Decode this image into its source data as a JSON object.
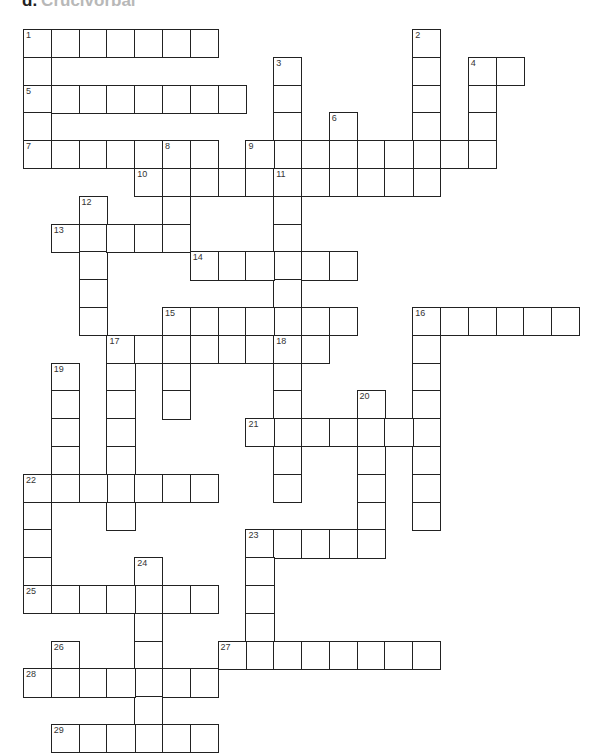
{
  "header": {
    "lead": "d.",
    "title": "Crucivorbal"
  },
  "grid": {
    "origin_x": 23,
    "origin_y": 29,
    "cell": 27.8,
    "border_color": "#222222"
  },
  "words": [
    {
      "num": "1",
      "dir": "across",
      "row": 0,
      "col": 0,
      "len": 7
    },
    {
      "num": "1",
      "dir": "down",
      "row": 0,
      "col": 0,
      "len": 5
    },
    {
      "num": "2",
      "dir": "down",
      "row": 0,
      "col": 14,
      "len": 6
    },
    {
      "num": "3",
      "dir": "down",
      "row": 1,
      "col": 9,
      "len": 4
    },
    {
      "num": "4",
      "dir": "across",
      "row": 1,
      "col": 16,
      "len": 2
    },
    {
      "num": "4",
      "dir": "down",
      "row": 1,
      "col": 16,
      "len": 4
    },
    {
      "num": "5",
      "dir": "across",
      "row": 2,
      "col": 0,
      "len": 8
    },
    {
      "num": "6",
      "dir": "down",
      "row": 3,
      "col": 11,
      "len": 3
    },
    {
      "num": "7",
      "dir": "across",
      "row": 4,
      "col": 0,
      "len": 7
    },
    {
      "num": "8",
      "dir": "down",
      "row": 4,
      "col": 5,
      "len": 4
    },
    {
      "num": "9",
      "dir": "across",
      "row": 4,
      "col": 8,
      "len": 9
    },
    {
      "num": "10",
      "dir": "across",
      "row": 5,
      "col": 4,
      "len": 11
    },
    {
      "num": "11",
      "dir": "down",
      "row": 5,
      "col": 9,
      "len": 6
    },
    {
      "num": "12",
      "dir": "down",
      "row": 6,
      "col": 2,
      "len": 5
    },
    {
      "num": "13",
      "dir": "across",
      "row": 7,
      "col": 1,
      "len": 5
    },
    {
      "num": "14",
      "dir": "across",
      "row": 8,
      "col": 6,
      "len": 6
    },
    {
      "num": "15",
      "dir": "across",
      "row": 10,
      "col": 5,
      "len": 7
    },
    {
      "num": "15",
      "dir": "down",
      "row": 10,
      "col": 5,
      "len": 4
    },
    {
      "num": "16",
      "dir": "across",
      "row": 10,
      "col": 14,
      "len": 6
    },
    {
      "num": "16",
      "dir": "down",
      "row": 10,
      "col": 14,
      "len": 8
    },
    {
      "num": "17",
      "dir": "across",
      "row": 11,
      "col": 3,
      "len": 8
    },
    {
      "num": "17",
      "dir": "down",
      "row": 11,
      "col": 3,
      "len": 7
    },
    {
      "num": "18",
      "dir": "down",
      "row": 11,
      "col": 9,
      "len": 6
    },
    {
      "num": "19",
      "dir": "down",
      "row": 12,
      "col": 1,
      "len": 5
    },
    {
      "num": "20",
      "dir": "down",
      "row": 13,
      "col": 12,
      "len": 6
    },
    {
      "num": "21",
      "dir": "across",
      "row": 14,
      "col": 8,
      "len": 7
    },
    {
      "num": "22",
      "dir": "across",
      "row": 16,
      "col": 0,
      "len": 7
    },
    {
      "num": "22",
      "dir": "down",
      "row": 16,
      "col": 0,
      "len": 5
    },
    {
      "num": "23",
      "dir": "across",
      "row": 18,
      "col": 8,
      "len": 5
    },
    {
      "num": "23",
      "dir": "down",
      "row": 18,
      "col": 8,
      "len": 5
    },
    {
      "num": "24",
      "dir": "down",
      "row": 19,
      "col": 4,
      "len": 7
    },
    {
      "num": "25",
      "dir": "across",
      "row": 20,
      "col": 0,
      "len": 7
    },
    {
      "num": "26",
      "dir": "down",
      "row": 22,
      "col": 1,
      "len": 2
    },
    {
      "num": "27",
      "dir": "across",
      "row": 22,
      "col": 7,
      "len": 8
    },
    {
      "num": "28",
      "dir": "across",
      "row": 23,
      "col": 0,
      "len": 7
    },
    {
      "num": "29",
      "dir": "across",
      "row": 25,
      "col": 1,
      "len": 6
    }
  ]
}
